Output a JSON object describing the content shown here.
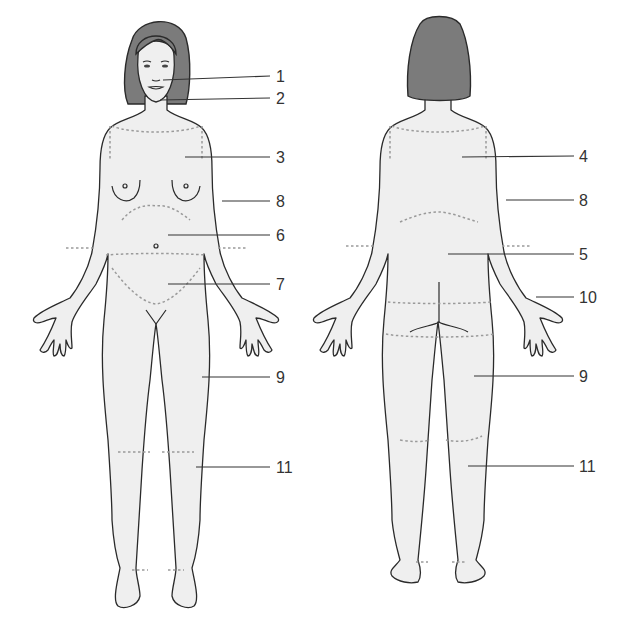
{
  "diagram": {
    "title": "",
    "views": [
      {
        "name": "front",
        "labels": [
          {
            "id": "1",
            "text": "1",
            "x": 276,
            "y": 82
          },
          {
            "id": "2",
            "text": "2",
            "x": 276,
            "y": 104
          },
          {
            "id": "3",
            "text": "3",
            "x": 276,
            "y": 162
          },
          {
            "id": "8",
            "text": "8",
            "x": 276,
            "y": 206
          },
          {
            "id": "6",
            "text": "6",
            "x": 276,
            "y": 240
          },
          {
            "id": "7",
            "text": "7",
            "x": 276,
            "y": 289
          },
          {
            "id": "9",
            "text": "9",
            "x": 276,
            "y": 382
          },
          {
            "id": "11",
            "text": "11",
            "x": 276,
            "y": 471
          }
        ]
      },
      {
        "name": "back",
        "labels": [
          {
            "id": "4",
            "text": "4",
            "x": 579,
            "y": 162
          },
          {
            "id": "8",
            "text": "8",
            "x": 579,
            "y": 206
          },
          {
            "id": "5",
            "text": "5",
            "x": 579,
            "y": 259
          },
          {
            "id": "10",
            "text": "10",
            "x": 579,
            "y": 302
          },
          {
            "id": "9",
            "text": "9",
            "x": 579,
            "y": 380
          },
          {
            "id": "11",
            "text": "11",
            "x": 579,
            "y": 470
          }
        ]
      }
    ]
  },
  "colors": {
    "skin": "#efefef",
    "hair": "#7b7b7b",
    "outline": "#2a2a2a",
    "dashed_region": "#9a9a9a"
  }
}
